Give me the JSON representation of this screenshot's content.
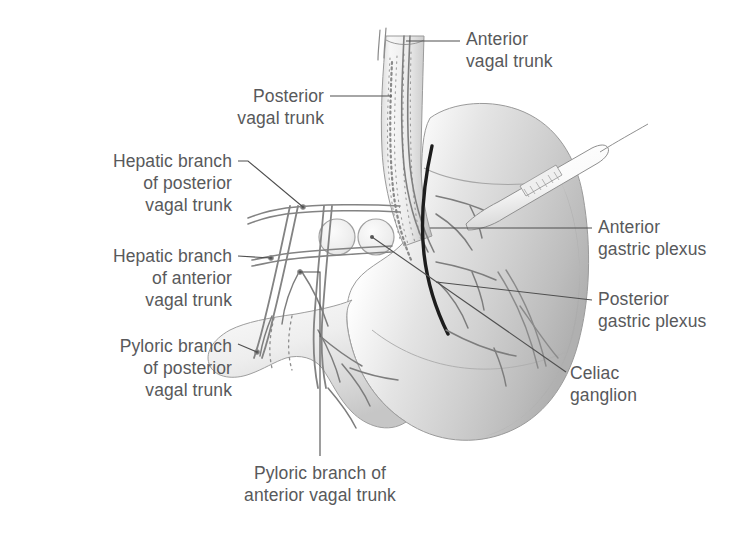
{
  "figure": {
    "background_color": "#ffffff",
    "label_color": "#58595b",
    "width": 756,
    "height": 538
  },
  "labels": {
    "anterior_vagal_trunk": "Anterior\nvagal trunk",
    "posterior_vagal_trunk": "Posterior\nvagal trunk",
    "hepatic_branch_posterior": "Hepatic branch\nof posterior\nvagal trunk",
    "hepatic_branch_anterior": "Hepatic branch\nof anterior\nvagal trunk",
    "pyloric_branch_posterior": "Pyloric branch\nof posterior\nvagal trunk",
    "pyloric_branch_anterior": "Pyloric branch of\nanterior vagal trunk",
    "anterior_gastric_plexus": "Anterior\ngastric plexus",
    "posterior_gastric_plexus": "Posterior\ngastric plexus",
    "celiac_ganglion": "Celiac\nganglion"
  },
  "structures": [
    {
      "name": "esophagus",
      "description": "vertical tube at top center with longitudinal striations"
    },
    {
      "name": "stomach-body",
      "description": "large shaded gastric body, greater curvature to the right"
    },
    {
      "name": "stomach-fundus",
      "description": "rounded dome at upper right of stomach"
    },
    {
      "name": "pylorus-duodenum",
      "description": "narrow curved tube at lower left"
    },
    {
      "name": "anterior-vagal-trunk-nerve",
      "description": "solid nerve descending anterior on esophagus"
    },
    {
      "name": "posterior-vagal-trunk-nerve",
      "description": "stippled nerve descending posterior on esophagus"
    },
    {
      "name": "celiac-ganglion-left",
      "description": "circular ganglion outline"
    },
    {
      "name": "celiac-ganglion-right",
      "description": "circular ganglion outline with leader dot"
    },
    {
      "name": "surgical-probe",
      "description": "instrument pointing at lesser curvature from upper right"
    },
    {
      "name": "gastric-plexus-black-line",
      "description": "dark bold nerve tracing the lesser curvature"
    }
  ]
}
